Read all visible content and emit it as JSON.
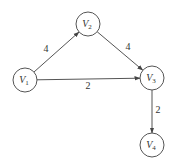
{
  "graph": {
    "nodes": [
      {
        "id": "V1",
        "letter": "V",
        "sub": "1"
      },
      {
        "id": "V2",
        "letter": "V",
        "sub": "2"
      },
      {
        "id": "V3",
        "letter": "V",
        "sub": "3"
      },
      {
        "id": "V4",
        "letter": "V",
        "sub": "4"
      }
    ],
    "edges": [
      {
        "from": "V1",
        "to": "V2",
        "weight": "4"
      },
      {
        "from": "V2",
        "to": "V3",
        "weight": "4"
      },
      {
        "from": "V1",
        "to": "V3",
        "weight": "2"
      },
      {
        "from": "V3",
        "to": "V4",
        "weight": "2"
      }
    ],
    "colors": {
      "stroke": "#555555",
      "text": "#333333"
    }
  }
}
